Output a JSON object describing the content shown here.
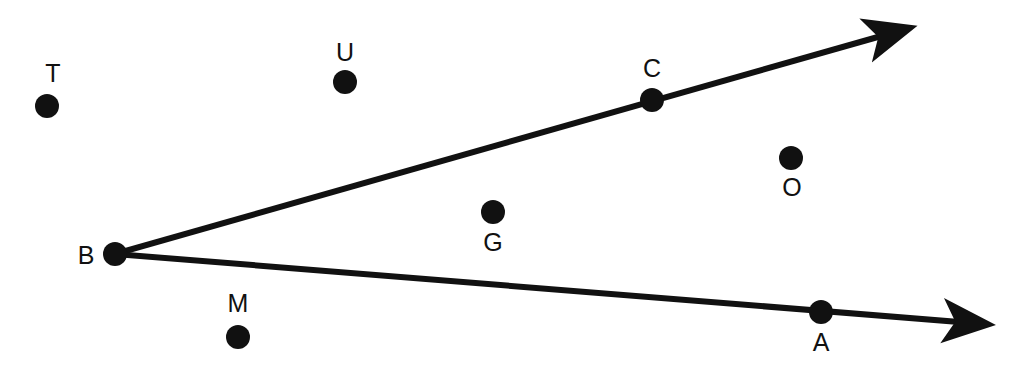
{
  "diagram": {
    "type": "geometry-angle",
    "colors": {
      "ink": "#111111",
      "background": "#ffffff"
    },
    "vertex": "B",
    "rays": [
      {
        "id": "ray-BC",
        "from": "B",
        "through": "C",
        "arrow": true
      },
      {
        "id": "ray-BA",
        "from": "B",
        "through": "A",
        "arrow": true
      }
    ],
    "points": [
      {
        "id": "T",
        "label": "T",
        "on_ray": null,
        "region": "exterior"
      },
      {
        "id": "U",
        "label": "U",
        "on_ray": null,
        "region": "exterior"
      },
      {
        "id": "C",
        "label": "C",
        "on_ray": "ray-BC",
        "region": "on-angle"
      },
      {
        "id": "O",
        "label": "O",
        "on_ray": null,
        "region": "interior"
      },
      {
        "id": "G",
        "label": "G",
        "on_ray": null,
        "region": "interior"
      },
      {
        "id": "B",
        "label": "B",
        "on_ray": "vertex",
        "region": "on-angle"
      },
      {
        "id": "M",
        "label": "M",
        "on_ray": null,
        "region": "exterior"
      },
      {
        "id": "A",
        "label": "A",
        "on_ray": "ray-BA",
        "region": "on-angle"
      }
    ]
  }
}
